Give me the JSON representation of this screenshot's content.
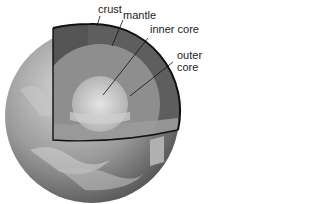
{
  "labels": {
    "crust": "crust",
    "mantle": "mantle",
    "inner_core": "inner core",
    "outer_core_line1": "outer",
    "outer_core_line2": "core"
  },
  "colors": {
    "background": "#ffffff",
    "crust_outline": "#111111",
    "mantle": "#5e5e5e",
    "outer_core": "#8e8e8e",
    "inner_core": "#c4c4c4",
    "globe": "#8a8a8a",
    "label_text": "#222222"
  }
}
